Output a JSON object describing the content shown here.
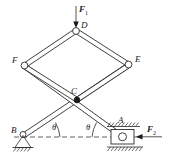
{
  "figure": {
    "background_color": "#ffffff",
    "line_color": "#2b2b2b",
    "label_color": "#1a1a1a"
  },
  "joints": [
    {
      "id": "D",
      "label": "D",
      "x": 76,
      "y": 31,
      "type": "open-pin",
      "note": "apex joint, load applied"
    },
    {
      "id": "F",
      "label": "F",
      "x": 25,
      "y": 66,
      "type": "open-pin",
      "note": "left joint"
    },
    {
      "id": "E",
      "label": "E",
      "x": 128,
      "y": 65,
      "type": "open-pin",
      "note": "right joint"
    },
    {
      "id": "C",
      "label": "C",
      "x": 77,
      "y": 100,
      "type": "solid-pin",
      "note": "crossing pin of members BE and AF"
    },
    {
      "id": "B",
      "label": "B",
      "x": 23,
      "y": 136,
      "type": "pin-support",
      "note": "fixed pin support on ground"
    },
    {
      "id": "A",
      "label": "A",
      "x": 122,
      "y": 136,
      "type": "roller-support",
      "note": "roller in horizontal guide"
    }
  ],
  "members": [
    {
      "from": "D",
      "to": "F",
      "style": "double-line"
    },
    {
      "from": "D",
      "to": "E",
      "style": "double-line"
    },
    {
      "from": "F",
      "to": "C",
      "style": "double-line"
    },
    {
      "from": "E",
      "to": "C",
      "style": "double-line"
    },
    {
      "from": "B",
      "to": "E",
      "style": "double-line",
      "note": "passes through C"
    },
    {
      "from": "A",
      "to": "F",
      "style": "double-line",
      "note": "passes through C"
    }
  ],
  "forces": [
    {
      "id": "F1",
      "label": "F",
      "subscript": "1",
      "direction": "down",
      "applied_at": "D",
      "label_x": 82,
      "label_y": 11
    },
    {
      "id": "F2",
      "label": "F",
      "subscript": "2",
      "direction": "left",
      "applied_at": "A",
      "label_x": 150,
      "label_y": 131
    }
  ],
  "angles": [
    {
      "id": "theta-left",
      "label": "θ",
      "at": "B",
      "label_x": 52,
      "label_y": 129,
      "note": "angle between member BE and horizontal datum"
    },
    {
      "id": "theta-right",
      "label": "θ",
      "at": "A",
      "label_x": 84,
      "label_y": 129,
      "note": "angle between member AF and horizontal datum"
    }
  ],
  "datum": {
    "id": "horizontal-datum",
    "style": "dashed",
    "y": 137,
    "x_start": 14,
    "x_end": 140
  },
  "supports": {
    "pin": {
      "joint": "B",
      "ground_hatch": true
    },
    "roller": {
      "joint": "A",
      "guide_hatch_top": true,
      "guide_hatch_bottom": true
    }
  }
}
